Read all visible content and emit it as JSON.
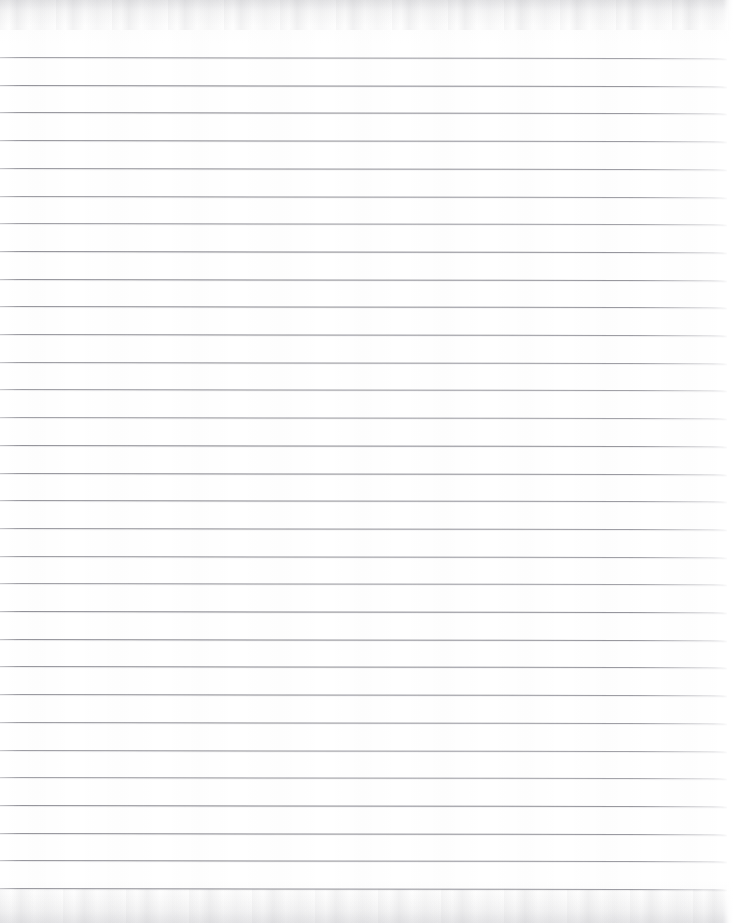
{
  "document": {
    "kind": "scanned-lined-paper",
    "title": "",
    "body_text": "",
    "visible_text": "",
    "page_width": 733,
    "page_height": 923,
    "background_color": "#ffffff",
    "paper_tone": "#fdfdfd",
    "is_blank": true
  },
  "ruling": {
    "line_color": "#7e7e86",
    "line_thickness_px": 1,
    "line_count": 31,
    "first_line_y": 57,
    "last_line_y": 888,
    "spacing_px": 27.7,
    "line_start_x": 0,
    "line_end_x": 727,
    "skew_degrees": 0.09,
    "lines_y": [
      57,
      84.7,
      112.4,
      140.1,
      167.8,
      195.5,
      223.2,
      250.9,
      278.6,
      306.3,
      334,
      361.7,
      389.4,
      417.1,
      444.8,
      472.5,
      500.2,
      527.9,
      555.6,
      583.3,
      611,
      638.7,
      666.4,
      694.1,
      721.8,
      749.5,
      777.2,
      804.9,
      832.6,
      860.3,
      888
    ]
  },
  "margins": {
    "top_blank_px": 57,
    "bottom_blank_px": 35,
    "right_edge_fade_px": 8,
    "has_vertical_margin_rule": false
  },
  "scan_artifacts": {
    "top_band_height_px": 30,
    "bottom_band_height_px": 34,
    "artifact_color": "#8a8a92",
    "has_speckle": true
  }
}
